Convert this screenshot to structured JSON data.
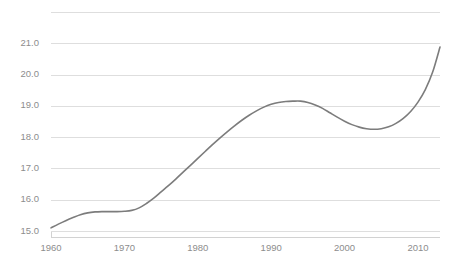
{
  "chart_data": {
    "type": "line",
    "title": "",
    "subtitle": "",
    "xlabel": "",
    "ylabel": "",
    "xlim": [
      1960,
      2013
    ],
    "ylim": [
      15.0,
      22.0
    ],
    "grid": true,
    "legend": false,
    "legend_position": "none",
    "line_color": "#7c7c7c",
    "grid_color": "#dedede",
    "axis_color": "#d2d2d2",
    "tick_label_color": "#8d8d8d",
    "y_ticks": [
      15.0,
      16.0,
      17.0,
      18.0,
      19.0,
      20.0,
      21.0
    ],
    "y_tick_labels": [
      "15.0",
      "16.0",
      "17.0",
      "18.0",
      "19.0",
      "20.0",
      "21.0"
    ],
    "y_gridlines": [
      15.0,
      16.0,
      17.0,
      18.0,
      19.0,
      20.0,
      21.0,
      22.0
    ],
    "x_ticks": [
      1960,
      1970,
      1980,
      1990,
      2000,
      2010
    ],
    "x_tick_labels": [
      "1960",
      "1970",
      "1980",
      "1990",
      "2000",
      "2010"
    ],
    "series": [
      {
        "name": "series-1",
        "x": [
          1960,
          1961,
          1962,
          1963,
          1964,
          1965,
          1966,
          1967,
          1968,
          1969,
          1970,
          1971,
          1972,
          1973,
          1974,
          1975,
          1976,
          1977,
          1978,
          1979,
          1980,
          1981,
          1982,
          1983,
          1984,
          1985,
          1986,
          1987,
          1988,
          1989,
          1990,
          1991,
          1992,
          1993,
          1994,
          1995,
          1996,
          1997,
          1998,
          1999,
          2000,
          2001,
          2002,
          2003,
          2004,
          2005,
          2006,
          2007,
          2008,
          2009,
          2010,
          2011,
          2012,
          2013
        ],
        "values": [
          15.1,
          15.22,
          15.33,
          15.43,
          15.52,
          15.58,
          15.61,
          15.62,
          15.62,
          15.62,
          15.63,
          15.66,
          15.74,
          15.88,
          16.05,
          16.25,
          16.45,
          16.66,
          16.88,
          17.1,
          17.32,
          17.54,
          17.76,
          17.97,
          18.17,
          18.36,
          18.54,
          18.7,
          18.84,
          18.96,
          19.05,
          19.11,
          19.14,
          19.15,
          19.15,
          19.11,
          19.03,
          18.92,
          18.78,
          18.64,
          18.51,
          18.4,
          18.32,
          18.27,
          18.25,
          18.27,
          18.33,
          18.44,
          18.6,
          18.82,
          19.12,
          19.52,
          20.08,
          20.88
        ]
      }
    ]
  },
  "plot": {
    "left": 51,
    "right": 440,
    "top": 12,
    "bottom": 231
  }
}
